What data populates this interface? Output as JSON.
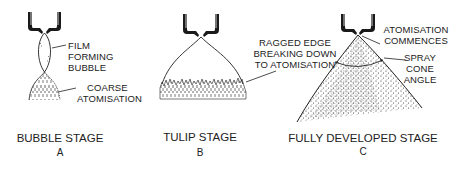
{
  "figure": {
    "panels": [
      {
        "id": "A",
        "stage_title": "BUBBLE STAGE",
        "letter": "A",
        "callouts": [
          {
            "lines": [
              "FILM",
              "FORMING",
              "BUBBLE"
            ]
          },
          {
            "lines": [
              "COARSE",
              "ATOMISATION"
            ]
          }
        ]
      },
      {
        "id": "B",
        "stage_title": "TULIP STAGE",
        "letter": "B",
        "callouts": [
          {
            "lines": [
              "RAGGED EDGE",
              "BREAKING DOWN",
              "TO ATOMISATION"
            ]
          }
        ]
      },
      {
        "id": "C",
        "stage_title": "FULLY DEVELOPED STAGE",
        "letter": "C",
        "callouts": [
          {
            "lines": [
              "ATOMISATION",
              "COMMENCES"
            ]
          },
          {
            "lines": [
              "SPRAY",
              "CONE",
              "ANGLE"
            ]
          }
        ]
      }
    ],
    "colors": {
      "ink": "#1f1f1f",
      "background": "#ffffff"
    }
  }
}
